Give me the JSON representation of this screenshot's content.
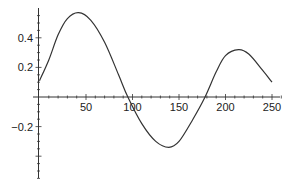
{
  "chart_data": {
    "type": "line",
    "title": "",
    "xlabel": "",
    "ylabel": "",
    "xlim": [
      0,
      260
    ],
    "ylim": [
      -0.55,
      0.6
    ],
    "x_ticks": [
      50,
      100,
      150,
      200,
      250
    ],
    "x_tick_labels": [
      "50",
      "100",
      "150",
      "200",
      "250"
    ],
    "y_ticks": [
      -0.2,
      0.2,
      0.4
    ],
    "y_tick_labels": [
      "-0.2",
      "0.2",
      "0.4"
    ],
    "grid": false,
    "legend": null,
    "series": [
      {
        "name": "curve",
        "x": [
          0,
          10,
          20,
          30,
          42,
          55,
          70,
          85,
          95,
          110,
          125,
          139,
          150,
          165,
          178,
          190,
          200,
          214,
          225,
          240,
          250
        ],
        "y": [
          0.11,
          0.25,
          0.42,
          0.53,
          0.57,
          0.52,
          0.37,
          0.15,
          0.0,
          -0.18,
          -0.3,
          -0.34,
          -0.3,
          -0.15,
          0.0,
          0.17,
          0.28,
          0.32,
          0.29,
          0.18,
          0.1
        ]
      }
    ]
  }
}
